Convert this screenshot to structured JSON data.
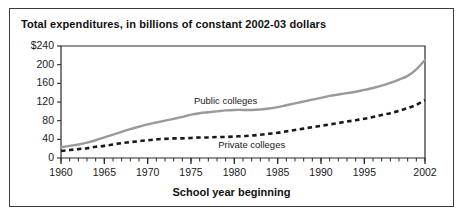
{
  "figure": {
    "title": "Total expenditures, in billions of constant 2002-03 dollars",
    "border_color": "#3b3b3b",
    "background": "#ffffff"
  },
  "chart_data": {
    "type": "line",
    "title": "Total expenditures, in billions of constant 2002-03 dollars",
    "xlabel": "School year beginning",
    "ylabel": "",
    "xlim": [
      1960,
      2002
    ],
    "ylim": [
      0,
      240
    ],
    "grid": false,
    "legend": "inline-annotations",
    "ytick_labels": [
      "$240",
      "200",
      "160",
      "120",
      "80",
      "40",
      "0"
    ],
    "ytick_values": [
      240,
      200,
      160,
      120,
      80,
      40,
      0
    ],
    "xtick_labels": [
      "1960",
      "1965",
      "1970",
      "1975",
      "1980",
      "1985",
      "1990",
      "1995",
      "2002"
    ],
    "xtick_values": [
      1960,
      1965,
      1970,
      1975,
      1980,
      1985,
      1990,
      1995,
      2002
    ],
    "minor_xticks_every": 1,
    "x": [
      1960,
      1961,
      1962,
      1963,
      1964,
      1965,
      1966,
      1967,
      1968,
      1969,
      1970,
      1971,
      1972,
      1973,
      1974,
      1975,
      1976,
      1977,
      1978,
      1979,
      1980,
      1981,
      1982,
      1983,
      1984,
      1985,
      1986,
      1987,
      1988,
      1989,
      1990,
      1991,
      1992,
      1993,
      1994,
      1995,
      1996,
      1997,
      1998,
      1999,
      2000,
      2001,
      2002
    ],
    "series": [
      {
        "name": "Public colleges",
        "style": "solid",
        "color": "#9a9a9a",
        "label_x": 1979,
        "label_y": 122,
        "values": [
          23,
          26,
          29,
          33,
          38,
          44,
          50,
          56,
          62,
          67,
          72,
          76,
          80,
          84,
          88,
          93,
          96,
          98,
          100,
          102,
          103,
          103,
          103,
          104,
          106,
          109,
          113,
          117,
          121,
          125,
          129,
          133,
          136,
          139,
          142,
          146,
          150,
          155,
          161,
          168,
          176,
          190,
          210
        ]
      },
      {
        "name": "Private colleges",
        "style": "dashed",
        "color": "#1a1a1a",
        "label_x": 1982,
        "label_y": 28,
        "values": [
          15,
          17,
          19,
          21,
          24,
          26,
          29,
          32,
          34,
          36,
          38,
          40,
          41,
          42,
          42,
          43,
          44,
          44,
          45,
          45,
          46,
          47,
          48,
          50,
          52,
          54,
          57,
          60,
          63,
          66,
          69,
          72,
          75,
          78,
          81,
          84,
          88,
          92,
          96,
          101,
          107,
          114,
          124
        ]
      }
    ]
  }
}
